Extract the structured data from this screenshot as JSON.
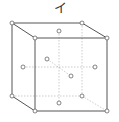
{
  "diagram": {
    "label": "イ",
    "type": "face-centered cubic unit cell",
    "colors": {
      "edge": "#555555",
      "hidden": "#999999",
      "atom_fill": "#ffffff",
      "atom_stroke": "#666666"
    }
  }
}
